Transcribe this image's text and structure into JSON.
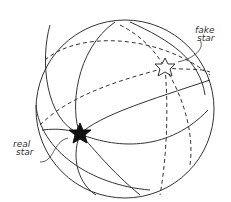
{
  "diagram": {
    "type": "sphere-with-great-circles",
    "labels": {
      "fake_star_line1": "fake",
      "fake_star_line2": "star",
      "real_star_line1": "real",
      "real_star_line2": "star"
    },
    "stroke_color": "#333333",
    "real_star_fill": "#111111",
    "fake_star_fill": "#ffffff"
  }
}
